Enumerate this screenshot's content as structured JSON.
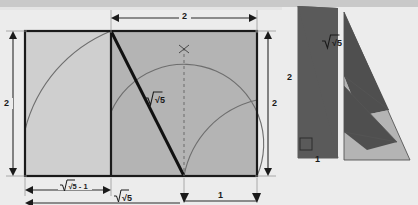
{
  "figure": {
    "background_color": "#ececec",
    "top_band_color": "#c9c9c9"
  },
  "palette": {
    "light_fill": "#cfcfcf",
    "mid_fill": "#b4b4b4",
    "dark_fill": "#5a5a5a",
    "outline": "#1a1a1a",
    "arc_stroke": "#6e6e6e",
    "dim_stroke": "#2a2a2a"
  },
  "left_panel": {
    "name": "golden-ratio-construction",
    "dimensions": [
      {
        "id": "top-width",
        "label": "2",
        "orientation": "horizontal",
        "position": "top-right-half"
      },
      {
        "id": "left-height",
        "label": "2",
        "orientation": "vertical",
        "position": "left"
      },
      {
        "id": "right-height",
        "label": "2",
        "orientation": "vertical",
        "position": "right"
      },
      {
        "id": "bottom-left-segment",
        "label": "√5 - 1",
        "orientation": "horizontal",
        "position": "bottom-left"
      },
      {
        "id": "bottom-mid-segment",
        "label": "√5",
        "orientation": "horizontal",
        "position": "bottom-middle"
      },
      {
        "id": "bottom-right-segment",
        "label": "1",
        "orientation": "horizontal",
        "position": "bottom-right"
      }
    ],
    "hypotenuse_label": "√5",
    "arcs": [
      {
        "id": "arc-from-top-right-of-left-square",
        "note": "quarter arc sweeping left-down"
      },
      {
        "id": "arc-radius-sqrt5",
        "note": "arc centered at bottom-left of right region"
      },
      {
        "id": "arc-radius-right",
        "note": "arc centered at bottom-right"
      }
    ],
    "markers": [
      {
        "id": "arc-intersection-cross",
        "label": "x-cross"
      },
      {
        "id": "vertical-dashed-axis",
        "label": "dashed"
      }
    ]
  },
  "right_panel": {
    "name": "triangle-dissection-proof",
    "labels": {
      "vertical_side": "2",
      "horizontal_side": "1",
      "hypotenuse": "√5"
    },
    "shapes": [
      {
        "id": "reference-right-triangle",
        "fill": "dark"
      },
      {
        "id": "right-angle-marker",
        "fill": "none"
      },
      {
        "id": "dissected-triangle-piece-1",
        "fill": "dark"
      },
      {
        "id": "dissected-triangle-piece-2",
        "fill": "mid"
      },
      {
        "id": "dissected-triangle-piece-3",
        "fill": "dark"
      },
      {
        "id": "dissected-triangle-piece-4",
        "fill": "mid"
      }
    ]
  }
}
